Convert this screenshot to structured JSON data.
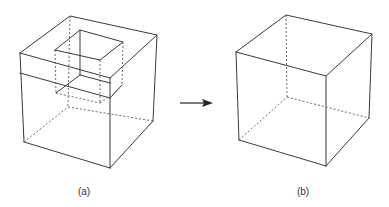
{
  "figure": {
    "panels": [
      {
        "id": "a",
        "label": "(a)",
        "description": "Cube with a square hole cut through from top"
      },
      {
        "id": "b",
        "label": "(b)",
        "description": "Solid cube"
      }
    ],
    "arrow": {
      "direction": "right",
      "meaning": "transforms to"
    },
    "colors": {
      "line": "#3a3a3a",
      "background": "#ffffff"
    }
  }
}
